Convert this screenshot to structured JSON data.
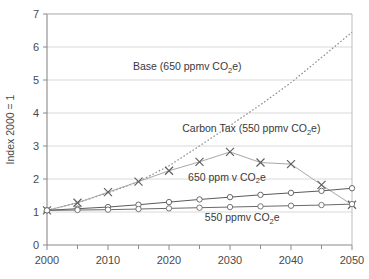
{
  "chart_data": {
    "type": "line",
    "title": "",
    "xlabel": "",
    "ylabel": "Index 2000 = 1",
    "xlim": [
      2000,
      2050
    ],
    "ylim": [
      0,
      7
    ],
    "grid": true,
    "legend_position": "inline-annotations",
    "x": [
      2000,
      2005,
      2010,
      2015,
      2020,
      2025,
      2030,
      2035,
      2040,
      2045,
      2050
    ],
    "xticks": [
      "2000",
      "2010",
      "2020",
      "2030",
      "2040",
      "2050"
    ],
    "xtick_values": [
      2000,
      2010,
      2020,
      2030,
      2040,
      2050
    ],
    "xminor_values": [
      2005,
      2015,
      2025,
      2035,
      2045
    ],
    "yticks": [
      "0",
      "1",
      "2",
      "3",
      "4",
      "5",
      "6",
      "7"
    ],
    "ytick_values": [
      0,
      1,
      2,
      3,
      4,
      5,
      6,
      7
    ],
    "series": [
      {
        "name": "Base (650 ppmv CO2e)",
        "label_text": "Base (650 ppmv CO",
        "label_sub": "2",
        "label_tail": "e)",
        "marker": "none",
        "linestyle": "dotted",
        "color": "#8c8c8c",
        "values": [
          1.05,
          1.28,
          1.58,
          1.92,
          2.4,
          3.0,
          3.62,
          4.25,
          4.92,
          5.68,
          6.45
        ]
      },
      {
        "name": "Carbon Tax (550 ppmv CO2e)",
        "label_text": "Carbon Tax (550 ppmv CO",
        "label_sub": "2",
        "label_tail": "e)",
        "marker": "x",
        "linestyle": "solid",
        "color": "#a8a8a8",
        "values": [
          1.05,
          1.28,
          1.6,
          1.92,
          2.25,
          2.52,
          2.82,
          2.5,
          2.45,
          1.82,
          1.22
        ]
      },
      {
        "name": "650 ppm v CO2e",
        "label_text": "650 ppm v CO",
        "label_sub": "2",
        "label_tail": "e",
        "marker": "circle",
        "linestyle": "solid",
        "color": "#5a5a5a",
        "values": [
          1.05,
          1.1,
          1.15,
          1.22,
          1.3,
          1.38,
          1.45,
          1.52,
          1.58,
          1.64,
          1.72
        ]
      },
      {
        "name": "550 ppmv CO2e",
        "label_text": "550 ppmv CO",
        "label_sub": "2",
        "label_tail": "e",
        "marker": "circle",
        "linestyle": "solid",
        "color": "#6a6a6a",
        "values": [
          1.05,
          1.06,
          1.07,
          1.09,
          1.11,
          1.13,
          1.15,
          1.17,
          1.19,
          1.21,
          1.24
        ]
      }
    ],
    "annotations": [
      {
        "name": "base-label",
        "text": "Base (650 ppmv CO2e)",
        "x": 2023.0,
        "y": 5.3
      },
      {
        "name": "carbon-tax-label",
        "text": "Carbon Tax (550 ppmv CO2e)",
        "x": 2033.5,
        "y": 3.42
      },
      {
        "name": "p650-label",
        "text": "650 ppm v CO2e",
        "x": 2029.5,
        "y": 1.95
      },
      {
        "name": "p550-label",
        "text": "550 ppmv CO2e",
        "x": 2032.0,
        "y": 0.72
      }
    ]
  }
}
